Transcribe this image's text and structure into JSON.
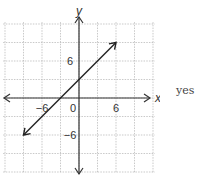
{
  "answer_label": "yes",
  "chart_data": {
    "type": "line",
    "title": "",
    "xlabel": "x",
    "ylabel": "y",
    "xlim": [
      -9,
      12
    ],
    "ylim": [
      -12,
      12
    ],
    "grid": true,
    "grid_step": 3,
    "x_tick_labels": [
      {
        "value": -6,
        "label": "−6"
      },
      {
        "value": 0,
        "label": "0"
      },
      {
        "value": 6,
        "label": "6"
      }
    ],
    "y_tick_labels": [
      {
        "value": 6,
        "label": "6"
      },
      {
        "value": -6,
        "label": "−6"
      }
    ],
    "series": [
      {
        "name": "y = x + 3",
        "equation": "y = x + 3",
        "slope": 1,
        "intercept": 3,
        "x": [
          -9,
          6
        ],
        "y": [
          -6,
          9
        ],
        "arrows_both_ends": true
      }
    ],
    "axes_arrows": true
  }
}
